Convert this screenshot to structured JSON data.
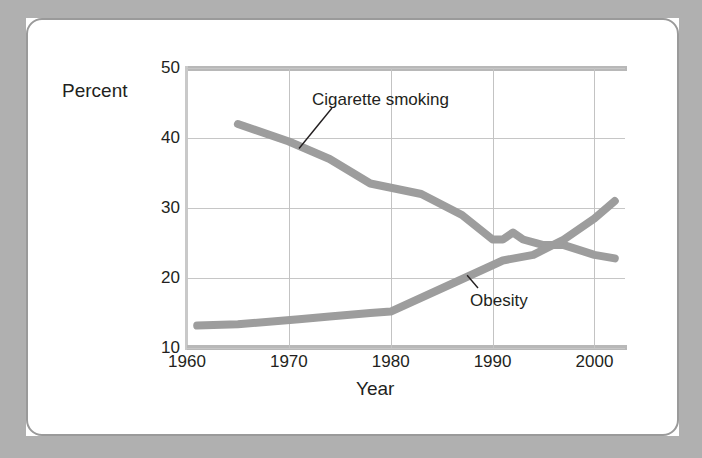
{
  "figure": {
    "frame_color": "#b0b0b0",
    "card_border_color": "#9a9a9a",
    "axis_title_y": "Percent",
    "axis_title_x": "Year"
  },
  "chart_data": {
    "type": "line",
    "title": "",
    "xlabel": "Year",
    "ylabel": "Percent",
    "xlim": [
      1960,
      2003
    ],
    "ylim": [
      10,
      50
    ],
    "yticks": [
      10,
      20,
      30,
      40,
      50
    ],
    "xticks": [
      1960,
      1970,
      1980,
      1990,
      2000
    ],
    "grid": "both",
    "legend_position": "inline-annotations",
    "series": [
      {
        "name": "Cigarette smoking",
        "color": "#9d9d9d",
        "label_x": 1978,
        "label_y": 45,
        "x": [
          1965,
          1970,
          1974,
          1978,
          1983,
          1987,
          1990,
          1991,
          1992,
          1993,
          1995,
          1997,
          2000,
          2002
        ],
        "y": [
          42.0,
          39.5,
          37.0,
          33.5,
          32.0,
          29.0,
          25.5,
          25.5,
          26.5,
          25.5,
          24.7,
          24.7,
          23.3,
          22.8
        ]
      },
      {
        "name": "Obesity",
        "color": "#9d9d9d",
        "label_x": 1992,
        "label_y": 17,
        "x": [
          1961,
          1965,
          1971,
          1974,
          1978,
          1980,
          1988,
          1991,
          1994,
          1997,
          2000,
          2002
        ],
        "y": [
          13.2,
          13.4,
          14.1,
          14.5,
          15.0,
          15.2,
          20.5,
          22.5,
          23.3,
          25.5,
          28.5,
          31.0
        ]
      }
    ],
    "annotations": [
      {
        "text": "Cigarette smoking",
        "points_to_series": "Cigarette smoking",
        "points_to_x": 1971,
        "points_to_y": 38.5
      },
      {
        "text": "Obesity",
        "points_to_series": "Obesity",
        "points_to_x": 1987,
        "points_to_y": 20.3
      }
    ]
  },
  "ytick_labels": [
    "50",
    "40",
    "30",
    "20",
    "10"
  ],
  "xtick_labels": [
    "1960",
    "1970",
    "1980",
    "1990",
    "2000"
  ],
  "series_labels": {
    "smoking": "Cigarette smoking",
    "obesity": "Obesity"
  }
}
